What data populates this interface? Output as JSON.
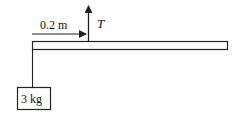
{
  "diagram": {
    "distance_label": "0.2 m",
    "force_label": "T",
    "mass_label": "3 kg",
    "colors": {
      "stroke": "#222222",
      "background": "#ffffff"
    }
  }
}
